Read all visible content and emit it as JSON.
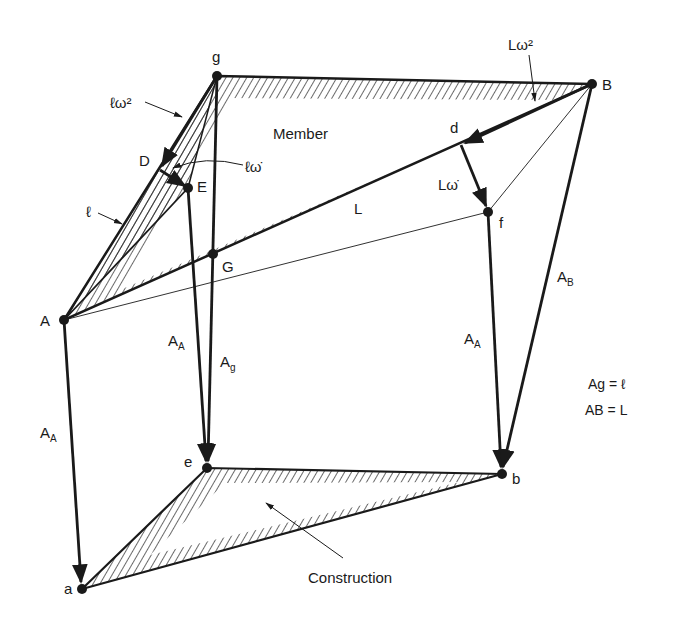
{
  "figure": {
    "width": 673,
    "height": 628,
    "colors": {
      "ink": "#1a1a1a",
      "background": "#ffffff"
    },
    "points": {
      "g": {
        "x": 217,
        "y": 76,
        "label": "g",
        "lx": 212,
        "ly": 62
      },
      "B": {
        "x": 592,
        "y": 84,
        "label": "B",
        "lx": 602,
        "ly": 90
      },
      "A": {
        "x": 64,
        "y": 320,
        "label": "A",
        "lx": 40,
        "ly": 326
      },
      "D": {
        "x": 160,
        "y": 170,
        "label": "D",
        "lx": 139,
        "ly": 166
      },
      "E": {
        "x": 188,
        "y": 188,
        "label": "E",
        "lx": 197,
        "ly": 192
      },
      "G": {
        "x": 213,
        "y": 254,
        "label": "G",
        "lx": 222,
        "ly": 272
      },
      "d": {
        "x": 461,
        "y": 145,
        "label": "d",
        "lx": 450,
        "ly": 133
      },
      "f": {
        "x": 488,
        "y": 212,
        "label": "f",
        "lx": 499,
        "ly": 228
      },
      "e": {
        "x": 207,
        "y": 468,
        "label": "e",
        "lx": 184,
        "ly": 467
      },
      "b": {
        "x": 502,
        "y": 474,
        "label": "b",
        "lx": 512,
        "ly": 484
      },
      "a": {
        "x": 82,
        "y": 589,
        "label": "a",
        "lx": 64,
        "ly": 594
      }
    },
    "labels": {
      "member": "Member",
      "construction": "Construction",
      "l_omega_sq": "ℓω²",
      "L_omega_sq": "Lω²",
      "l_omega_dot": "ℓω̇",
      "L_omega_dot": "Lω̇",
      "l": "ℓ",
      "L": "L",
      "A_A_left": "A",
      "A_A_left_sub": "A",
      "A_A_mid": "A",
      "A_A_mid_sub": "A",
      "A_g": "A",
      "A_g_sub": "g",
      "A_A_right": "A",
      "A_A_right_sub": "A",
      "A_B": "A",
      "A_B_sub": "B",
      "eq1": "Ag = ℓ",
      "eq2": "AB = L"
    }
  }
}
